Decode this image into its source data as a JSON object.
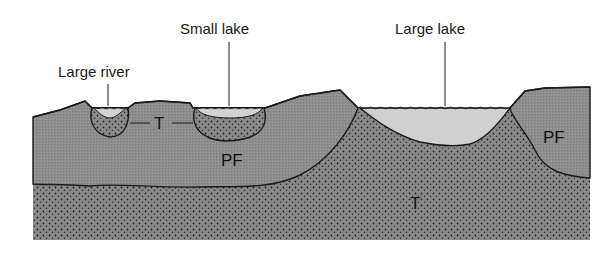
{
  "diagram": {
    "type": "cross-section",
    "labels": {
      "large_river": "Large river",
      "small_lake": "Small lake",
      "large_lake": "Large lake",
      "talik_t1": "T",
      "talik_t2": "T",
      "permafrost_left": "PF",
      "permafrost_right": "PF"
    },
    "legend_meaning": {
      "PF": "permafrost",
      "T": "talik (unfrozen ground)"
    },
    "colors": {
      "permafrost_fill": "#8c8c8c",
      "talik_fill": "#7a7a7a",
      "water_fill": "#cfcfcf",
      "outline": "#1a1a1a",
      "background": "#ffffff"
    }
  }
}
